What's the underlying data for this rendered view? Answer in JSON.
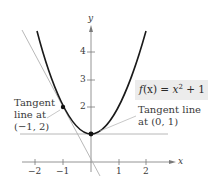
{
  "figure": {
    "function_label": {
      "f": "f",
      "paren_x": "(x)",
      "eq": " = ",
      "x": "x",
      "exp": "2",
      "rest": " + 1"
    },
    "axes": {
      "x_label": "x",
      "y_label": "y",
      "x_ticks": [
        "−2",
        "−1",
        "1",
        "2"
      ],
      "y_ticks": [
        "2",
        "3",
        "4"
      ]
    },
    "annotations": {
      "left_line1": "Tangent",
      "left_line2": "line at",
      "left_line3": "(−1,  2)",
      "right_line1": "Tangent line",
      "right_line2": "at (0,  1)"
    },
    "points": [
      {
        "x": -1,
        "y": 2
      },
      {
        "x": 0,
        "y": 1
      }
    ],
    "colors": {
      "curve": "#1a1a1a",
      "tangent": "#b0b0b0",
      "axis": "#7a7a7a",
      "label_box": "#ececec"
    }
  }
}
